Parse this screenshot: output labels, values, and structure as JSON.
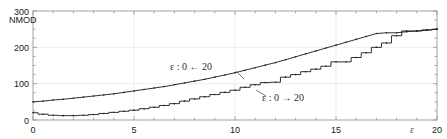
{
  "chart_data": {
    "type": "line",
    "title": "",
    "xlabel": "ε",
    "ylabel": "NMOD",
    "xlim": [
      0,
      20
    ],
    "ylim": [
      0,
      300
    ],
    "grid": true,
    "legend_position": "inline-annotations",
    "x_ticks": [
      0,
      5,
      10,
      15,
      20
    ],
    "x_tick_labels": [
      "0",
      "5",
      "10",
      "15",
      "20"
    ],
    "x_minor_step": 1,
    "y_ticks": [
      0,
      100,
      200,
      300
    ],
    "y_tick_labels": [
      "0",
      "100",
      "200",
      "300"
    ],
    "y_minor_step": 25,
    "series": [
      {
        "name": "ε : 0 ← 20",
        "label_text": "ε : 0 ← 20",
        "style": "smooth-descending-sweep",
        "x": [
          0,
          0.5,
          1,
          1.5,
          2,
          2.5,
          3,
          3.5,
          4,
          4.5,
          5,
          5.5,
          6,
          6.5,
          7,
          7.5,
          8,
          8.5,
          9,
          9.5,
          10,
          10.5,
          11,
          11.5,
          12,
          12.5,
          13,
          13.5,
          14,
          14.5,
          15,
          15.5,
          16,
          16.5,
          17,
          17.5,
          18,
          18.5,
          19,
          19.5,
          20
        ],
        "values": [
          50,
          52,
          55,
          57,
          60,
          63,
          66,
          69,
          72,
          76,
          80,
          84,
          88,
          92,
          97,
          102,
          107,
          112,
          118,
          124,
          130,
          137,
          144,
          151,
          158,
          166,
          174,
          182,
          190,
          198,
          206,
          214,
          222,
          230,
          238,
          240,
          240,
          243,
          245,
          247,
          250
        ]
      },
      {
        "name": "ε : 0 → 20",
        "label_text": "ε : 0 → 20",
        "style": "staircase-ascending-sweep",
        "x": [
          0,
          0.5,
          1,
          1.5,
          2,
          2.5,
          3,
          3.5,
          4,
          4.5,
          5,
          5.5,
          6,
          6.5,
          7,
          7.5,
          8,
          8.5,
          9,
          9.5,
          10,
          10.5,
          11,
          11.5,
          12,
          12.5,
          13,
          13.5,
          14,
          14.5,
          15,
          15.5,
          16,
          16.5,
          17,
          17.5,
          18,
          18.5,
          19,
          19.5,
          20
        ],
        "values": [
          20,
          16,
          13,
          12,
          12,
          13,
          15,
          18,
          21,
          24,
          27,
          31,
          35,
          40,
          45,
          52,
          58,
          64,
          70,
          76,
          82,
          90,
          97,
          103,
          104,
          118,
          125,
          133,
          140,
          148,
          160,
          160,
          172,
          185,
          200,
          212,
          232,
          245,
          245,
          248,
          250
        ]
      }
    ],
    "annotations": [
      {
        "id": "upper-branch-annotation",
        "text": "ε : 0 ← 20",
        "target_x": 10.0,
        "target_y": 130
      },
      {
        "id": "lower-branch-annotation",
        "text": "ε : 0 → 20",
        "target_x": 11.0,
        "target_y": 97
      }
    ]
  },
  "axes": {
    "y_axis_name": "NMOD",
    "x_axis_symbol": "ε"
  },
  "colors": {
    "curve": "#1a1a1a",
    "frame": "#8a8a8a",
    "grid": "#e2e2e2",
    "text": "#1a1a1a",
    "annotation": "#2b2b2b"
  }
}
